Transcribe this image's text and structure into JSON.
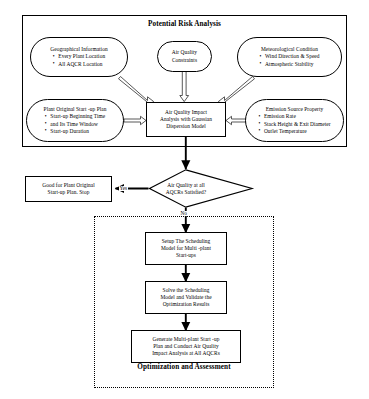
{
  "diagram": {
    "sections": {
      "top": {
        "title": "Potential Risk Analysis"
      },
      "bottom": {
        "title": "Optimization and Assessment"
      }
    },
    "nodes": {
      "geographical_information": {
        "header": "Geographical Information",
        "bullets": [
          "Every Plant Location",
          "All AQCR Location"
        ]
      },
      "air_quality_constraints": {
        "line1": "Air Quality",
        "line2": "Constraints"
      },
      "meteorological_condition": {
        "header": "Meteorological Condition",
        "bullets": [
          "Wind Direction & Speed",
          "Atmospheric Stability"
        ]
      },
      "plant_original_startup_plan": {
        "header": "Plant Original Start -up Plan",
        "bullets": [
          "Start-up Beginning Time",
          "and Its Time Window",
          "Start-up Duration"
        ]
      },
      "air_quality_impact_analysis": {
        "line1": "Air Quality Impact",
        "line2": "Analysis with Gaussian",
        "line3": "Dispersion Model"
      },
      "emission_source_property": {
        "header": "Emission Source Property",
        "bullets": [
          "Emission Rate",
          "Stack Height & Exit Diameter",
          "Outlet Temperature"
        ]
      },
      "decision_air_quality": {
        "line1": "Air Quality at all",
        "line2": "AQCRs Satisfied?"
      },
      "good_for_plant_original": {
        "line1": "Good for Plant Original",
        "line2": "Start-up Plan. Stop"
      },
      "setup_scheduling_model": {
        "line1": "Setup The Scheduling",
        "line2": "Model for Multi -plant",
        "line3": "Start-ups"
      },
      "solve_scheduling_model": {
        "line1": "Solve the Scheduling",
        "line2": "Model and Validate the",
        "line3": "Optimization Results"
      },
      "generate_multiplant_plan": {
        "line1": "Generate Multi-plant Start -up",
        "line2": "Plan and Conduct Air Quality",
        "line3": "Impact Analysis at  All AQCRs"
      }
    },
    "edges": {
      "yes_label": "Yes",
      "no_label": "No"
    },
    "colors": {
      "line": "#000000",
      "background": "#ffffff",
      "hollow_arrow_fill": "#ffffff"
    }
  }
}
